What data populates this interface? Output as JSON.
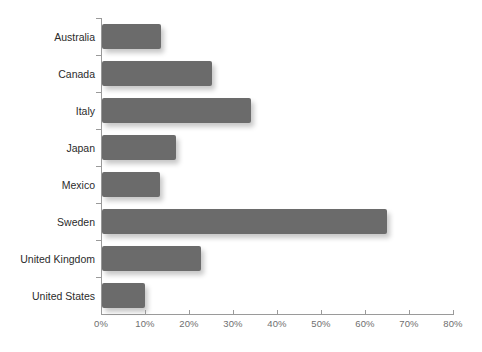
{
  "chart_data": {
    "type": "bar",
    "orientation": "horizontal",
    "title": "",
    "xlabel": "",
    "ylabel": "",
    "categories": [
      "Australia",
      "Canada",
      "Italy",
      "Japan",
      "Mexico",
      "Sweden",
      "United Kingdom",
      "United States"
    ],
    "values": [
      13.5,
      25.0,
      33.8,
      16.8,
      13.2,
      64.7,
      22.5,
      9.8
    ],
    "value_unit": "%",
    "xlim": [
      0,
      80
    ],
    "xticks": [
      0,
      10,
      20,
      30,
      40,
      50,
      60,
      70,
      80
    ],
    "xtick_labels": [
      "0%",
      "10%",
      "20%",
      "30%",
      "40%",
      "50%",
      "60%",
      "70%",
      "80%"
    ],
    "grid": false,
    "legend": false,
    "bar_color": "#6b6b6b",
    "axis_color": "#9a9a9a",
    "label_color": "#2b2b2b",
    "tick_label_color": "#6f6f6f",
    "background": "#ffffff"
  },
  "caption": {
    "text": ""
  }
}
